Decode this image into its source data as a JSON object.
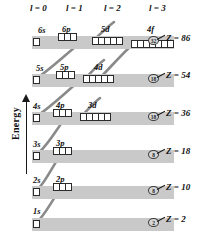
{
  "figure": {
    "type": "aufbau-energy-level-diagram",
    "axis_label": "Energy",
    "axis_direction": "up"
  },
  "column_headers": [
    {
      "label": "l = 0",
      "x": 30,
      "y": 3
    },
    {
      "label": "l = 1",
      "x": 66,
      "y": 3
    },
    {
      "label": "l = 2",
      "x": 104,
      "y": 3
    },
    {
      "label": "l = 3",
      "x": 149,
      "y": 3
    }
  ],
  "shells": [
    {
      "name": "shell-n6",
      "band": {
        "y": 36,
        "width": 142
      },
      "z_label": "Z = 86",
      "z_value": 86,
      "count": "32",
      "count_x": 148,
      "count_y": 36,
      "tick_x": 157,
      "tick_y": 39,
      "z_x": 166,
      "z_y": 33,
      "orbitals": [
        {
          "label": "6s",
          "boxes": 1,
          "label_x": 38,
          "label_y": 25,
          "box_x": 33,
          "box_y": 38
        },
        {
          "label": "6p",
          "boxes": 3,
          "label_x": 62,
          "label_y": 24,
          "box_x": 58,
          "box_y": 33
        },
        {
          "label": "5d",
          "boxes": 5,
          "label_x": 101,
          "label_y": 24,
          "box_x": 92,
          "box_y": 37
        },
        {
          "label": "4f",
          "boxes": 7,
          "label_x": 147,
          "label_y": 24,
          "box_x": 131,
          "box_y": 40
        }
      ]
    },
    {
      "name": "shell-n5",
      "band": {
        "y": 74,
        "width": 142
      },
      "z_label": "Z = 54",
      "z_value": 54,
      "count": "18",
      "count_x": 148,
      "count_y": 74,
      "tick_x": 157,
      "tick_y": 77,
      "z_x": 166,
      "z_y": 70,
      "orbitals": [
        {
          "label": "5s",
          "boxes": 1,
          "label_x": 36,
          "label_y": 63,
          "box_x": 33,
          "box_y": 76
        },
        {
          "label": "5p",
          "boxes": 3,
          "label_x": 60,
          "label_y": 62,
          "box_x": 56,
          "box_y": 71
        },
        {
          "label": "4d",
          "boxes": 5,
          "label_x": 94,
          "label_y": 62,
          "box_x": 83,
          "box_y": 75
        }
      ]
    },
    {
      "name": "shell-n4",
      "band": {
        "y": 112,
        "width": 142
      },
      "z_label": "Z = 36",
      "z_value": 36,
      "count": "18",
      "count_x": 148,
      "count_y": 112,
      "tick_x": 157,
      "tick_y": 115,
      "z_x": 166,
      "z_y": 108,
      "orbitals": [
        {
          "label": "4s",
          "boxes": 1,
          "label_x": 33,
          "label_y": 101,
          "box_x": 33,
          "box_y": 114
        },
        {
          "label": "4p",
          "boxes": 3,
          "label_x": 56,
          "label_y": 100,
          "box_x": 53,
          "box_y": 109
        },
        {
          "label": "3d",
          "boxes": 5,
          "label_x": 88,
          "label_y": 100,
          "box_x": 80,
          "box_y": 113
        }
      ]
    },
    {
      "name": "shell-n3",
      "band": {
        "y": 150,
        "width": 142
      },
      "z_label": "Z = 18",
      "z_value": 18,
      "count": "8",
      "count_x": 148,
      "count_y": 150,
      "tick_x": 157,
      "tick_y": 153,
      "z_x": 166,
      "z_y": 146,
      "orbitals": [
        {
          "label": "3s",
          "boxes": 1,
          "label_x": 33,
          "label_y": 139,
          "box_x": 33,
          "box_y": 152
        },
        {
          "label": "3p",
          "boxes": 3,
          "label_x": 56,
          "label_y": 138,
          "box_x": 53,
          "box_y": 147
        }
      ]
    },
    {
      "name": "shell-n2",
      "band": {
        "y": 186,
        "width": 142
      },
      "z_label": "Z = 10",
      "z_value": 10,
      "count": "8",
      "count_x": 148,
      "count_y": 186,
      "tick_x": 157,
      "tick_y": 189,
      "z_x": 166,
      "z_y": 182,
      "orbitals": [
        {
          "label": "2s",
          "boxes": 1,
          "label_x": 33,
          "label_y": 175,
          "box_x": 33,
          "box_y": 188
        },
        {
          "label": "2p",
          "boxes": 3,
          "label_x": 56,
          "label_y": 174,
          "box_x": 53,
          "box_y": 183
        }
      ]
    },
    {
      "name": "shell-n1",
      "band": {
        "y": 218,
        "width": 142
      },
      "z_label": "Z = 2",
      "z_value": 2,
      "count": "2",
      "count_x": 148,
      "count_y": 218,
      "tick_x": 157,
      "tick_y": 221,
      "z_x": 166,
      "z_y": 214,
      "orbitals": [
        {
          "label": "1s",
          "boxes": 1,
          "label_x": 33,
          "label_y": 206,
          "box_x": 33,
          "box_y": 220
        }
      ]
    }
  ],
  "connectors": [
    {
      "name": "line-1s-2p",
      "d": "M 37 222 C 45 215, 52 200, 60 190"
    },
    {
      "name": "line-2s-3p",
      "d": "M 37 190 C 46 182, 54 163, 62 153"
    },
    {
      "name": "line-3s-4p",
      "d": "M 37 154 C 48 146, 58 126, 68 115"
    },
    {
      "name": "line-4s-3d-5p",
      "d": "M 37 116 C 52 106, 68 90, 84 77"
    },
    {
      "name": "line-5s-4d-6p",
      "d": "M 37 78 C 52 68, 68 52, 84 40"
    },
    {
      "name": "line-3d-4p-up",
      "d": "M 80 118 C 86 112, 92 104, 100 98"
    },
    {
      "name": "line-4d-5p-up",
      "d": "M 84 80 C 90 74, 96 66, 104 60"
    },
    {
      "name": "line-4f-5d",
      "d": "M 131 46 C 122 54, 108 70, 96 82"
    },
    {
      "name": "line-5d-6p-up",
      "d": "M 92 42 C 98 36, 106 28, 114 22"
    }
  ],
  "colors": {
    "band": "#c9c9c9",
    "box_fill": "#ffffff",
    "box_stroke": "#2b2b2b",
    "connector": "#8a8a8a",
    "text": "#111111"
  }
}
